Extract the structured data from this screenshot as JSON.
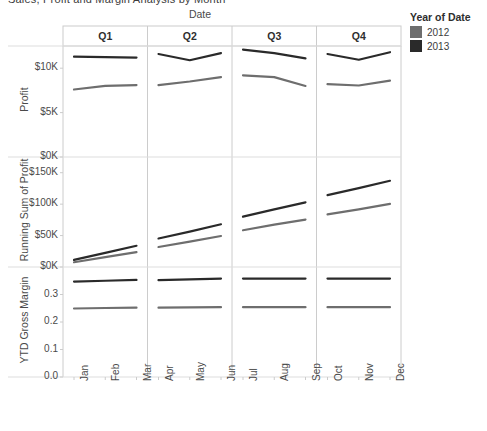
{
  "window": {
    "clipped_title": "Sales, Profit and Margin Analysis by Month"
  },
  "legend": {
    "title": "Year of Date",
    "items": [
      {
        "label": "2012",
        "color": "#6e6e6e"
      },
      {
        "label": "2013",
        "color": "#2a2a2a"
      }
    ]
  },
  "columns": {
    "caption": "Date",
    "headers": [
      "Q1",
      "Q2",
      "Q3",
      "Q4"
    ]
  },
  "rows": [
    {
      "title": "Profit",
      "ticks": [
        "$10K",
        "$5K",
        "$0K"
      ]
    },
    {
      "title": "Running Sum of Profit",
      "ticks": [
        "$150K",
        "$100K",
        "$50K",
        "$0K"
      ]
    },
    {
      "title": "YTD Gross Margin",
      "ticks": [
        "0.3",
        "0.2",
        "0.1",
        "0.0"
      ]
    }
  ],
  "x_ticks": [
    "Jan",
    "Feb",
    "Mar",
    "Apr",
    "May",
    "Jun",
    "Jul",
    "Aug",
    "Sep",
    "Oct",
    "Nov",
    "Dec"
  ],
  "chart_data": {
    "type": "line",
    "title": "Sales, Profit and Margin Analysis by Month",
    "xlabel": "Date",
    "legend_title": "Year of Date",
    "legend_position": "right",
    "grid": true,
    "layout": "3 rows (measures) x 4 columns (quarters), trellis",
    "x": [
      "Jan",
      "Feb",
      "Mar",
      "Apr",
      "May",
      "Jun",
      "Jul",
      "Aug",
      "Sep",
      "Oct",
      "Nov",
      "Dec"
    ],
    "quarters": [
      "Q1",
      "Q2",
      "Q3",
      "Q4"
    ],
    "panels": [
      {
        "ylabel": "Profit",
        "ytick_labels": [
          "$0K",
          "$5K",
          "$10K"
        ],
        "ytick_values": [
          0,
          5000,
          10000
        ],
        "ylim": [
          0,
          12500
        ],
        "series": [
          {
            "name": "2012",
            "color": "#6e6e6e",
            "values": [
              7600,
              8000,
              8100,
              8100,
              8500,
              9000,
              9200,
              9000,
              8000,
              8200,
              8050,
              8600
            ]
          },
          {
            "name": "2013",
            "color": "#2a2a2a",
            "values": [
              11300,
              11250,
              11200,
              11600,
              10900,
              11700,
              12100,
              11700,
              11100,
              11600,
              10950,
              11800
            ]
          }
        ]
      },
      {
        "ylabel": "Running Sum of Profit",
        "ytick_labels": [
          "$0K",
          "$50K",
          "$100K",
          "$150K"
        ],
        "ytick_values": [
          0,
          50000,
          100000,
          150000
        ],
        "ylim": [
          0,
          175000
        ],
        "series": [
          {
            "name": "2012",
            "color": "#6e6e6e",
            "values": [
              7600,
              15600,
              23700,
              31800,
              40300,
              49300,
              58500,
              67500,
              75500,
              83700,
              91750,
              100350
            ]
          },
          {
            "name": "2013",
            "color": "#2a2a2a",
            "values": [
              11300,
              22550,
              33750,
              45350,
              56250,
              67950,
              80050,
              91750,
              102850,
              114450,
              125400,
              137200
            ]
          }
        ]
      },
      {
        "ylabel": "YTD Gross Margin",
        "ytick_labels": [
          "0.0",
          "0.1",
          "0.2",
          "0.3"
        ],
        "ytick_values": [
          0.0,
          0.1,
          0.2,
          0.3
        ],
        "ylim": [
          0.0,
          0.4
        ],
        "series": [
          {
            "name": "2012",
            "color": "#6e6e6e",
            "values": [
              0.249,
              0.251,
              0.252,
              0.252,
              0.253,
              0.254,
              0.254,
              0.254,
              0.254,
              0.254,
              0.254,
              0.254
            ]
          },
          {
            "name": "2013",
            "color": "#2a2a2a",
            "values": [
              0.347,
              0.35,
              0.353,
              0.352,
              0.355,
              0.358,
              0.358,
              0.358,
              0.358,
              0.358,
              0.358,
              0.358
            ]
          }
        ]
      }
    ]
  },
  "style": {
    "grid_color": "#dddddd",
    "axis_color": "#cccccc",
    "text_color": "#4a4a4a"
  }
}
